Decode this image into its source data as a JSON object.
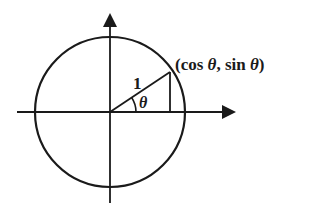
{
  "diagram": {
    "colors": {
      "stroke": "#1a1a1a",
      "background": "#ffffff"
    },
    "labels": {
      "point": "(cos θ, sin θ)",
      "point_parts": {
        "open": "(cos ",
        "theta1": "θ",
        "mid": ", sin ",
        "theta2": "θ",
        "close": ")"
      },
      "radius": "1",
      "angle": "θ"
    },
    "geometry": {
      "center": [
        110,
        112
      ],
      "radius": 75,
      "angle_degrees": 34,
      "point_on_circle": [
        170,
        72
      ],
      "x_axis": {
        "from": 17,
        "to": 236
      },
      "y_axis": {
        "from": 13,
        "to": 203
      }
    }
  }
}
